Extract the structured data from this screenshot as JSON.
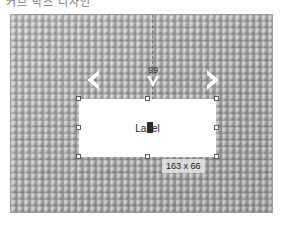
{
  "window": {
    "clipped_header_text": "커브 박스 디자인"
  },
  "canvas": {
    "background_color": "#b3b3b3",
    "border_color": "#9c9c9c",
    "texture": "studded-baseplate"
  },
  "guides": {
    "vertical_guide_color": "#464646",
    "spacing_value": "99",
    "spacing_arrow_icon": "chevron-down-icon",
    "left_arrow_icon": "chevron-left-icon",
    "left_arrow_glyph": "<",
    "right_arrow_icon": "chevron-right-icon",
    "right_arrow_glyph": ">",
    "arrow_color": "#ffffff"
  },
  "selection": {
    "element_label": "Label",
    "element_fill": "#ffffff",
    "handle_fill": "#ffffff",
    "handle_stroke": "#5a5a5a",
    "handle_count": 8,
    "dimension_label": "163 x 66",
    "width_px": 163,
    "height_px": 66,
    "caret_visible": true
  }
}
